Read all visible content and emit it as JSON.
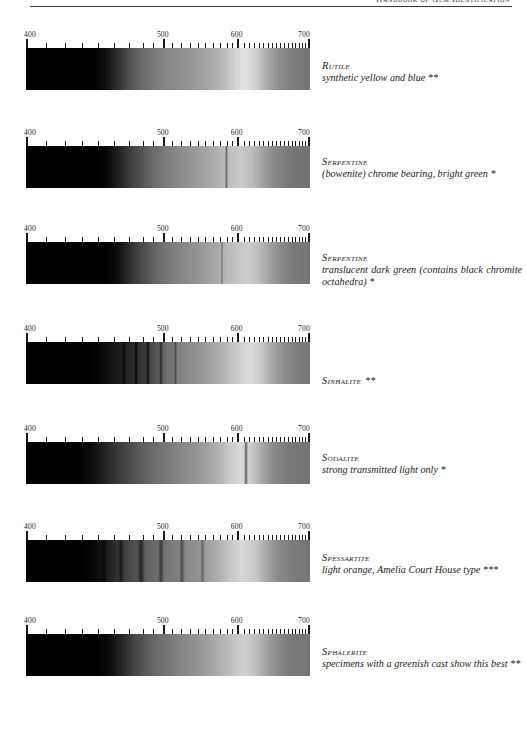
{
  "running_head": {
    "text": "Handbook of Gem Identification"
  },
  "scale": {
    "axis_labels": [
      "400",
      "500",
      "600",
      "700"
    ],
    "axis_label_positions_pct": [
      0,
      48.2,
      74.2,
      100
    ],
    "unit": "nm",
    "tick_positions_pct": [
      0,
      7.0,
      13.6,
      19.7,
      25.5,
      31.0,
      36.2,
      41.1,
      44.8,
      48.2,
      51.5,
      54.6,
      57.6,
      60.4,
      63.1,
      65.7,
      68.2,
      70.6,
      72.5,
      74.2,
      76.6,
      78.4,
      80.2,
      81.9,
      83.5,
      85.1,
      86.6,
      88.1,
      89.5,
      90.9,
      92.2,
      93.5,
      94.8,
      96.0,
      97.2,
      98.4,
      100
    ],
    "major_tick_positions_pct": [
      0,
      48.2,
      74.2,
      100
    ]
  },
  "spectra": [
    {
      "id": "rutile",
      "mineral": "Rutile",
      "description": "synthetic yellow and blue **",
      "stars": 2,
      "top": 32,
      "caption_top": 60,
      "caption_inline": false,
      "gradient": "linear-gradient(to right, #000000 0%, #000000 24%, #0b0b0b 27%, #2c2c2c 32%, #4e4e4e 36%, #6a6a6a 41%, #7d7d7d 46%, #8a8a8a 52%, #969696 58%, #a5a5a5 64%, #bdbdbd 70%, #d6d6d6 74%, #e2e2e2 77%, #cfcfcf 81%, #a9a9a9 85%, #8e8e8e 89%, #808080 93%, #787878 97%, #747474 100%)",
      "absorption_lines": []
    },
    {
      "id": "serpentine-bowenite",
      "mineral": "Serpentine",
      "description": "(bowenite) chrome bearing, bright green *",
      "stars": 1,
      "top": 130,
      "caption_top": 156,
      "caption_inline": false,
      "gradient": "linear-gradient(to right, #000000 0%, #000000 26%, #0a0a0a 29%, #242424 33%, #3e3e3e 37%, #555555 41%, #6a6a6a 45%, #7b7b7b 49%, #8a8a8a 54%, #989898 59%, #a6a6a6 64%, #b6b6b6 69%, #c2c2c2 73%, #c9c9c9 76%, #b9b9b9 80%, #9d9d9d 84%, #868686 88%, #7a7a7a 92%, #747474 96%, #727272 100%)",
      "absorption_lines": [
        {
          "pos_pct": 70.5,
          "width_pct": 1.2,
          "color": "rgba(0,0,0,0.45)"
        }
      ]
    },
    {
      "id": "serpentine-translucent",
      "mineral": "Serpentine",
      "description": "translucent dark green (contains black chromite octahedra) *",
      "stars": 1,
      "top": 226,
      "caption_top": 252,
      "caption_inline": false,
      "gradient": "linear-gradient(to right, #000000 0%, #000000 28%, #0d0d0d 32%, #2a2a2a 36%, #464646 40%, #5d5d5d 44%, #707070 48%, #7e7e7e 52%, #8b8b8b 57%, #999999 62%, #a8a8a8 67%, #b9b9b9 71%, #c6c6c6 75%, #cccccc 78%, #bcbcbc 82%, #a0a0a0 86%, #888888 90%, #7b7b7b 94%, #757575 100%)",
      "absorption_lines": [
        {
          "pos_pct": 69.0,
          "width_pct": 1.0,
          "color": "rgba(0,0,0,0.40)"
        }
      ]
    },
    {
      "id": "sinhalite",
      "mineral": "Sinhalite",
      "description": "**",
      "stars": 2,
      "top": 326,
      "caption_top": 370,
      "caption_inline": true,
      "gradient": "linear-gradient(to right, #000000 0%, #000000 22%, #060606 26%, #141414 30%, #1f1f1f 34%, #2a2a2a 38%, #3b3b3b 42%, #585858 46%, #6e6e6e 50%, #808080 54%, #8d8d8d 58%, #9a9a9a 63%, #acacac 68%, #c0c0c0 72%, #d2d2d2 76%, #dcdcdc 79%, #c8c8c8 83%, #a5a5a5 87%, #8c8c8c 91%, #7e7e7e 95%, #787878 100%)",
      "absorption_lines": [
        {
          "pos_pct": 34.5,
          "width_pct": 1.4,
          "color": "rgba(0,0,0,0.78)"
        },
        {
          "pos_pct": 38.8,
          "width_pct": 1.2,
          "color": "rgba(0,0,0,0.70)"
        },
        {
          "pos_pct": 43.0,
          "width_pct": 1.6,
          "color": "rgba(0,0,0,0.72)"
        },
        {
          "pos_pct": 47.5,
          "width_pct": 1.3,
          "color": "rgba(0,0,0,0.55)"
        },
        {
          "pos_pct": 52.5,
          "width_pct": 1.1,
          "color": "rgba(0,0,0,0.40)"
        }
      ]
    },
    {
      "id": "sodalite",
      "mineral": "Sodalite",
      "description": "strong transmitted light only *",
      "stars": 1,
      "top": 426,
      "caption_top": 452,
      "caption_inline": false,
      "gradient": "linear-gradient(to right, #000000 0%, #000000 18%, #0c0c0c 23%, #242424 28%, #3c3c3c 33%, #525252 38%, #656565 43%, #757575 48%, #828282 53%, #8f8f8f 58%, #9e9e9e 63%, #b3b3b3 68%, #cacaca 72%, #dadada 76%, #c4c4c4 80%, #9f9f9f 84%, #868686 88%, #7a7a7a 92%, #747474 100%)",
      "absorption_lines": [
        {
          "pos_pct": 77.5,
          "width_pct": 1.4,
          "color": "rgba(0,0,0,0.50)"
        }
      ]
    },
    {
      "id": "spessartite",
      "mineral": "Spessartite",
      "description": "light orange, Amelia Court House type ***",
      "stars": 3,
      "top": 524,
      "caption_top": 552,
      "caption_inline": false,
      "gradient": "linear-gradient(to right, #000000 0%, #000000 20%, #080808 24%, #1b1b1b 28%, #303030 32%, #464646 36%, #585858 40%, #666666 44%, #727272 48%, #7f7f7f 53%, #8c8c8c 58%, #9b9b9b 63%, #b0b0b0 68%, #c6c6c6 72%, #d8d8d8 76%, #c6c6c6 81%, #a4a4a4 85%, #8a8a8a 89%, #7c7c7c 94%, #767676 100%)",
      "absorption_lines": [
        {
          "pos_pct": 27.5,
          "width_pct": 2.2,
          "color": "rgba(0,0,0,0.55)"
        },
        {
          "pos_pct": 33.5,
          "width_pct": 2.0,
          "color": "rgba(0,0,0,0.50)"
        },
        {
          "pos_pct": 40.5,
          "width_pct": 2.6,
          "color": "rgba(0,0,0,0.52)"
        },
        {
          "pos_pct": 47.5,
          "width_pct": 2.2,
          "color": "rgba(0,0,0,0.45)"
        },
        {
          "pos_pct": 55.0,
          "width_pct": 2.0,
          "color": "rgba(0,0,0,0.38)"
        },
        {
          "pos_pct": 62.0,
          "width_pct": 1.8,
          "color": "rgba(0,0,0,0.30)"
        }
      ]
    },
    {
      "id": "sphalerite",
      "mineral": "Sphalerite",
      "description": "specimens with a greenish cast show this best **",
      "stars": 2,
      "top": 618,
      "caption_top": 646,
      "caption_inline": false,
      "gradient": "linear-gradient(to right, #000000 0%, #000000 25%, #0a0a0a 29%, #222222 33%, #3c3c3c 37%, #545454 41%, #676767 45%, #777777 50%, #858585 55%, #939393 60%, #a3a3a3 65%, #b6b6b6 70%, #c6c6c6 74%, #cfcfcf 77%, #bebebe 81%, #a0a0a0 85%, #888888 89%, #7b7b7b 93%, #757575 100%)",
      "absorption_lines": []
    }
  ]
}
